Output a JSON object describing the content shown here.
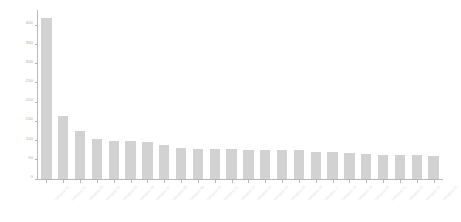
{
  "chart_data": {
    "type": "bar",
    "title": "",
    "subtitle": "",
    "xlabel": "",
    "ylabel": "",
    "grid": false,
    "legend": false,
    "ylim": [
      0,
      440
    ],
    "ytick_values": [
      0,
      50,
      100,
      150,
      200,
      250,
      300,
      350,
      400
    ],
    "ytick_labels": [
      "0",
      "50",
      "100",
      "150",
      "200",
      "250",
      "300",
      "350",
      "400"
    ],
    "bar_color": "#d2d2d2",
    "axis_color": "#b8b8b8",
    "tick_label_color": "#b0b0b0",
    "xtick_label_color": "#dcdcdc",
    "xtick_rotation": -45,
    "categories": [
      "category 01",
      "category 02",
      "category 03",
      "category 04",
      "category 05",
      "category 06",
      "category 07",
      "category 08",
      "category 09",
      "category 10",
      "category 11",
      "category 12",
      "category 13",
      "category 14",
      "category 15",
      "category 16",
      "category 17",
      "category 18",
      "category 19",
      "category 20",
      "category 21",
      "category 22",
      "category 23",
      "category 24"
    ],
    "values": [
      420,
      165,
      125,
      105,
      100,
      98,
      96,
      88,
      82,
      78,
      77,
      77,
      75,
      75,
      75,
      75,
      70,
      70,
      68,
      65,
      62,
      62,
      62,
      60
    ]
  }
}
